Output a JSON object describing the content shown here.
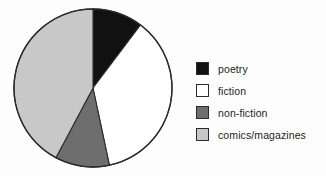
{
  "chart_data": {
    "type": "pie",
    "title": "",
    "categories": [
      "poetry",
      "fiction",
      "non-fiction",
      "comics/magazines"
    ],
    "values": [
      10.3,
      36.4,
      11.1,
      42.2
    ],
    "angles_deg": [
      37,
      131,
      40,
      152
    ],
    "start_angle_deg": 0,
    "direction": "clockwise",
    "colors": [
      "#111111",
      "#ffffff",
      "#6e6e6e",
      "#c8c8c8"
    ],
    "edge_color": "#2b2b2b",
    "legend_position": "right",
    "grid": false,
    "xlabel": "",
    "ylabel": ""
  },
  "legend": {
    "items": [
      {
        "label": "poetry",
        "color": "#111111"
      },
      {
        "label": "fiction",
        "color": "#ffffff"
      },
      {
        "label": "non-fiction",
        "color": "#6e6e6e"
      },
      {
        "label": "comics/magazines",
        "color": "#c8c8c8"
      }
    ]
  },
  "pie": {
    "center_x": 81,
    "center_y": 83,
    "radius": 79,
    "slices": [
      {
        "name": "poetry",
        "start": 0,
        "end": 37,
        "color": "#111111"
      },
      {
        "name": "fiction",
        "start": 37,
        "end": 168,
        "color": "#ffffff"
      },
      {
        "name": "non-fiction",
        "start": 168,
        "end": 208,
        "color": "#6e6e6e"
      },
      {
        "name": "comics/magazines",
        "start": 208,
        "end": 360,
        "color": "#c8c8c8"
      }
    ]
  }
}
